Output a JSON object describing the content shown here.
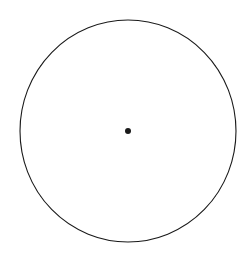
{
  "figure": {
    "background_color": "#ffffff",
    "canvas": {
      "width": 252,
      "height": 253
    }
  },
  "chart_data": {
    "type": "pie",
    "title": "",
    "subtitle": "",
    "xlabel": "",
    "ylabel": "",
    "legend": [],
    "legend_position": "none",
    "grid": false,
    "labels_shown": false,
    "values_shown": false,
    "slice_count": 20,
    "slice_angle_degrees": 18,
    "equal_slices": true,
    "categories": [
      "Sector 1",
      "Sector 2",
      "Sector 3",
      "Sector 4",
      "Sector 5",
      "Sector 6",
      "Sector 7",
      "Sector 8",
      "Sector 9",
      "Sector 10",
      "Sector 11",
      "Sector 12",
      "Sector 13",
      "Sector 14",
      "Sector 15",
      "Sector 16",
      "Sector 17",
      "Sector 18",
      "Sector 19",
      "Sector 20"
    ],
    "values": [
      5,
      5,
      5,
      5,
      5,
      5,
      5,
      5,
      5,
      5,
      5,
      5,
      5,
      5,
      5,
      5,
      5,
      5,
      5,
      5
    ],
    "value_unit": "percent",
    "total": 100,
    "start_angle_degrees": 90,
    "direction": "clockwise",
    "boundary_angles_degrees": [
      0,
      18,
      36,
      54,
      72,
      90,
      108,
      126,
      144,
      162,
      180,
      198,
      216,
      234,
      252,
      270,
      288,
      306,
      324,
      342
    ],
    "sectors_per_quadrant": 5,
    "slice_fill_color": "#ffffff",
    "stroke_color": "#1a1a1a",
    "stroke_width": 1
  },
  "geometry": {
    "center_x": 128,
    "center_y": 131,
    "radius_x": 108,
    "radius_y": 111,
    "outline_color": "#1a1a1a",
    "outline_width": 1.1,
    "spoke_color": "#1a1a1a",
    "spoke_width": 0.9,
    "hub_radius": 3,
    "hub_color": "#1a1a1a"
  }
}
